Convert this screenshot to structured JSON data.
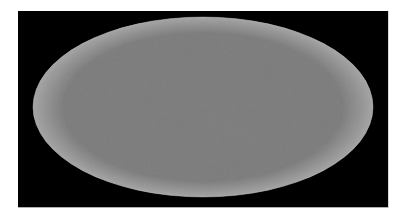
{
  "figure": {
    "kind": "all-sky-map",
    "projection": "Mollweide",
    "colormap": "grayscale",
    "title": "",
    "caption": "",
    "background_color": "#000000",
    "page_color": "#ffffff",
    "frame": {
      "x": 18,
      "y": 11,
      "width": 370,
      "height": 196
    },
    "ellipse": {
      "cx": 185,
      "cy": 96,
      "rx": 170,
      "ry": 90
    }
  },
  "chart_data": {
    "type": "heatmap",
    "title": "",
    "subtitle": "",
    "xlabel": "",
    "ylabel": "",
    "projection": "Mollweide",
    "grid": false,
    "legend_position": "none",
    "colorbar": false,
    "colorscale": [
      "#111111",
      "#404040",
      "#808080",
      "#b8b8b8",
      "#ffffff"
    ],
    "value_range": [
      -1.0,
      1.0
    ],
    "xlim": [
      -180,
      180
    ],
    "ylim": [
      -90,
      90
    ],
    "tick_labels_x": [],
    "tick_labels_y": [],
    "annotations": [],
    "mean_level": 0.52,
    "texture_scale_deg": 1.2,
    "hotspots": [
      {
        "x": 0.02,
        "y": 0.18,
        "amp": -0.85,
        "r": 0.16
      },
      {
        "x": 0.05,
        "y": 0.05,
        "amp": -0.7,
        "r": 0.1
      },
      {
        "x": -0.1,
        "y": 0.1,
        "amp": -0.55,
        "r": 0.09
      },
      {
        "x": -0.52,
        "y": -0.35,
        "amp": -0.6,
        "r": 0.12
      },
      {
        "x": -0.62,
        "y": 0.42,
        "amp": -0.6,
        "r": 0.11
      },
      {
        "x": 0.55,
        "y": -0.45,
        "amp": -0.62,
        "r": 0.12
      },
      {
        "x": 0.72,
        "y": 0.35,
        "amp": -0.58,
        "r": 0.11
      },
      {
        "x": -0.3,
        "y": -0.55,
        "amp": -0.5,
        "r": 0.1
      },
      {
        "x": 0.3,
        "y": 0.62,
        "amp": -0.48,
        "r": 0.1
      },
      {
        "x": 0.85,
        "y": 0.05,
        "amp": -0.45,
        "r": 0.09
      },
      {
        "x": -0.85,
        "y": -0.05,
        "amp": -0.4,
        "r": 0.09
      },
      {
        "x": 0.62,
        "y": -0.05,
        "amp": 0.55,
        "r": 0.13
      },
      {
        "x": -0.35,
        "y": 0.28,
        "amp": 0.45,
        "r": 0.11
      },
      {
        "x": 0.12,
        "y": -0.62,
        "amp": 0.48,
        "r": 0.1
      },
      {
        "x": -0.7,
        "y": 0.62,
        "amp": 0.4,
        "r": 0.09
      },
      {
        "x": 0.4,
        "y": 0.45,
        "amp": 0.35,
        "r": 0.09
      }
    ]
  }
}
